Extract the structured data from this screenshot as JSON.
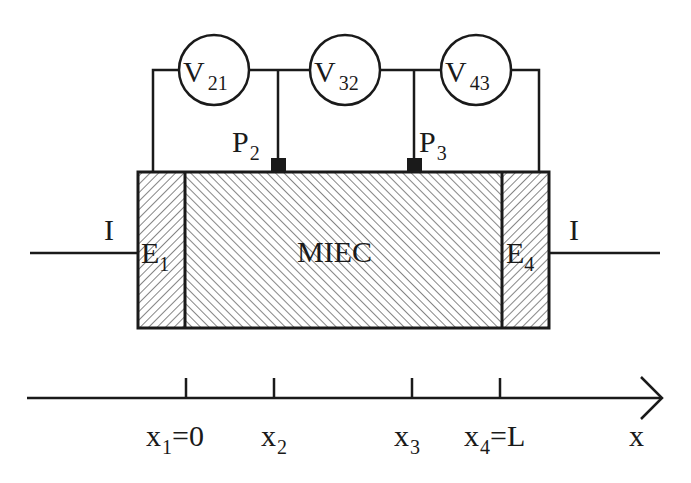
{
  "diagram": {
    "sample_label": "MIEC",
    "current_label_left": "I",
    "current_label_right": "I",
    "electrodes": [
      {
        "main": "E",
        "sub": "1"
      },
      {
        "main": "E",
        "sub": "4"
      }
    ],
    "probes": [
      {
        "main": "P",
        "sub": "2"
      },
      {
        "main": "P",
        "sub": "3"
      }
    ],
    "voltmeters": [
      {
        "main": "V",
        "sub": "21"
      },
      {
        "main": "V",
        "sub": "32"
      },
      {
        "main": "V",
        "sub": "43"
      }
    ],
    "axis": {
      "label": "x",
      "ticks": [
        {
          "main": "x",
          "sub": "1",
          "suffix": "=0"
        },
        {
          "main": "x",
          "sub": "2",
          "suffix": ""
        },
        {
          "main": "x",
          "sub": "3",
          "suffix": ""
        },
        {
          "main": "x",
          "sub": "4",
          "suffix": "=L"
        }
      ]
    },
    "colors": {
      "line": "#1a1a1a",
      "hatch": "#3a3a3a",
      "background": "#ffffff"
    }
  }
}
